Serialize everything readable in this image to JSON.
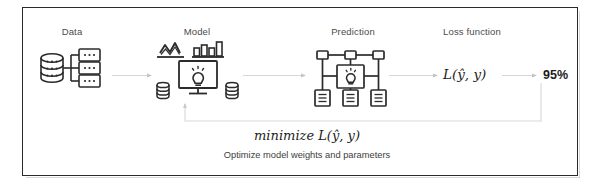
{
  "diagram": {
    "title_frame": "machine-learning-training-loop",
    "stages": [
      {
        "key": "data",
        "label": "Data",
        "icon": "database-branching-records-icon"
      },
      {
        "key": "model",
        "label": "Model",
        "icon": "monitor-lightbulb-analytics-icon"
      },
      {
        "key": "prediction",
        "label": "Prediction",
        "icon": "neural-network-lightbulb-documents-icon"
      },
      {
        "key": "loss",
        "label": "Loss function",
        "icon": "none"
      }
    ],
    "loss_formula": "L(ŷ, y)",
    "accuracy": "95%",
    "feedback": {
      "formula": "minimize L(ŷ, y)",
      "caption": "Optimize model weights and parameters"
    },
    "colors": {
      "frame_border": "#2b2b2b",
      "icon_stroke": "#2b2b2b",
      "label_text": "#4a4a4a",
      "arrow": "#cfcfcf",
      "feedback_arrow": "#d2d2d2",
      "background": "#ffffff"
    }
  }
}
